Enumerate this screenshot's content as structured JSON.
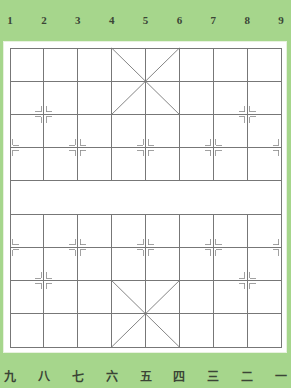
{
  "board": {
    "type": "xiangqi",
    "columns": 9,
    "rows": 10,
    "colors": {
      "background": "#a6d68c",
      "panel": "#ffffff",
      "lines": "#777777",
      "labels": "#3b4536"
    }
  },
  "top_labels": [
    "1",
    "2",
    "3",
    "4",
    "5",
    "6",
    "7",
    "8",
    "9"
  ],
  "bottom_labels": [
    "九",
    "八",
    "七",
    "六",
    "五",
    "四",
    "三",
    "二",
    "一"
  ],
  "river": {
    "left_text": "",
    "right_text": ""
  },
  "markers": {
    "cannon_positions": [
      [
        1,
        2
      ],
      [
        7,
        2
      ],
      [
        1,
        7
      ],
      [
        7,
        7
      ]
    ],
    "soldier_positions": [
      [
        0,
        3
      ],
      [
        2,
        3
      ],
      [
        4,
        3
      ],
      [
        6,
        3
      ],
      [
        8,
        3
      ],
      [
        0,
        6
      ],
      [
        2,
        6
      ],
      [
        4,
        6
      ],
      [
        6,
        6
      ],
      [
        8,
        6
      ]
    ]
  }
}
